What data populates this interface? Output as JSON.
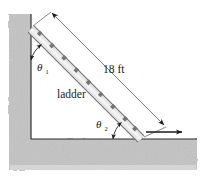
{
  "figure": {
    "labels": {
      "length": "18 ft",
      "object": "ladder",
      "theta1": "θ",
      "theta1_sub": "1",
      "theta2": "θ",
      "theta2_sub": "2"
    },
    "colors": {
      "wall_fill": "#c6c6c6",
      "wall_shade": "#bdbdbd",
      "ladder_fill": "#e3e3e3",
      "ladder_edge": "#6f6f6f",
      "rung": "#7a7a7a",
      "line": "#1a1a1a",
      "background": "#ffffff"
    },
    "geometry": {
      "ladder_top": [
        31,
        29
      ],
      "ladder_bottom": [
        141,
        139
      ],
      "wall_inner_x": 31,
      "floor_inner_y": 139,
      "rung_count": 9,
      "dimension_arrow_start": [
        51,
        12
      ],
      "dimension_arrow_end": [
        165,
        126
      ],
      "floor_arrow_start": [
        146,
        132
      ],
      "floor_arrow_end": [
        183,
        132
      ]
    }
  }
}
